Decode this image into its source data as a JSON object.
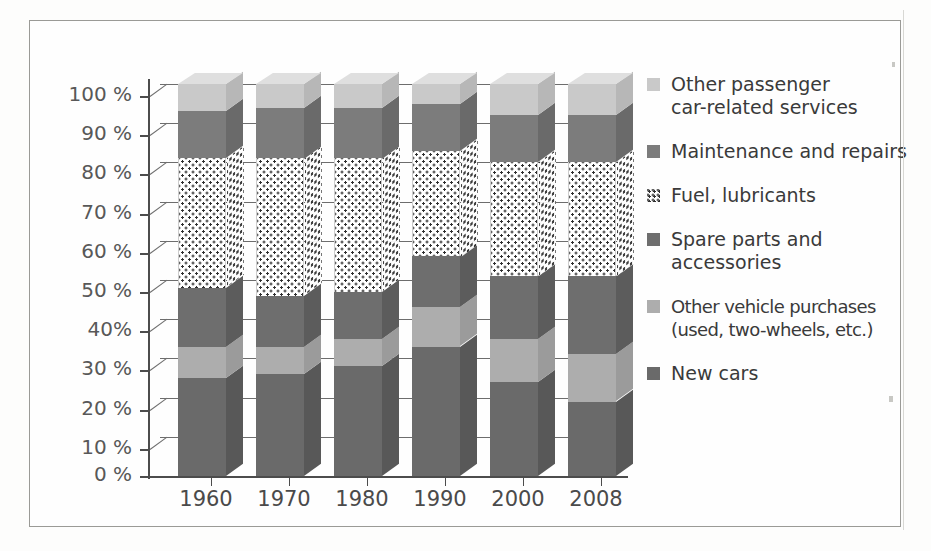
{
  "figure": {
    "kind": "stacked-bar-chart-100pct",
    "frame_border_color": "#9a9a96"
  },
  "axes": {
    "y_tick_labels": [
      "100 %",
      "90 %",
      "80 %",
      "70 %",
      "60 %",
      "50 %",
      "40%",
      "30 %",
      "20 %",
      "10 %",
      "0 %"
    ],
    "y_tick_values": [
      100,
      90,
      80,
      70,
      60,
      50,
      40,
      30,
      20,
      10,
      0
    ],
    "x_tick_labels": [
      "1960",
      "1970",
      "1980",
      "1990",
      "2000",
      "2008"
    ]
  },
  "legend": {
    "items": [
      {
        "label": "Other passenger\ncar-related services",
        "color": "#c9c9c9",
        "pattern": "solid",
        "name": "other-passenger-car-related-services"
      },
      {
        "label": "Maintenance and repairs",
        "color": "#7c7c7c",
        "pattern": "solid",
        "name": "maintenance-and-repairs"
      },
      {
        "label": "Fuel, lubricants",
        "color": "#ffffff",
        "pattern": "dotted",
        "name": "fuel-lubricants"
      },
      {
        "label": "Spare parts and\naccessories",
        "color": "#6e6e6e",
        "pattern": "solid",
        "name": "spare-parts-and-accessories"
      },
      {
        "label": "Other vehicle purchases\n(used, two-wheels, etc.)",
        "color": "#adadad",
        "pattern": "solid",
        "name": "other-vehicle-purchases"
      },
      {
        "label": "New cars",
        "color": "#6a6a6a",
        "pattern": "solid",
        "name": "new-cars"
      }
    ]
  },
  "chart_data": {
    "type": "bar",
    "stacked": true,
    "normalized": true,
    "title": "",
    "xlabel": "",
    "ylabel": "",
    "ylim": [
      0,
      100
    ],
    "grid": true,
    "legend_position": "right",
    "categories": [
      "1960",
      "1970",
      "1980",
      "1990",
      "2000",
      "2008"
    ],
    "series": [
      {
        "name": "New cars",
        "color": "#6a6a6a",
        "pattern": "solid",
        "values": [
          25,
          26,
          28,
          33,
          24,
          19
        ]
      },
      {
        "name": "Other vehicle purchases (used, two-wheels, etc.)",
        "color": "#adadad",
        "pattern": "solid",
        "values": [
          8,
          7,
          7,
          10,
          11,
          12
        ]
      },
      {
        "name": "Spare parts and accessories",
        "color": "#6e6e6e",
        "pattern": "solid",
        "values": [
          15,
          13,
          12,
          13,
          16,
          20
        ]
      },
      {
        "name": "Fuel, lubricants",
        "color": "#ffffff",
        "pattern": "dotted",
        "values": [
          33,
          35,
          34,
          27,
          29,
          29
        ]
      },
      {
        "name": "Maintenance and repairs",
        "color": "#7c7c7c",
        "pattern": "solid",
        "values": [
          12,
          13,
          13,
          12,
          12,
          12
        ]
      },
      {
        "name": "Other passenger car-related services",
        "color": "#c9c9c9",
        "pattern": "solid",
        "values": [
          7,
          6,
          6,
          5,
          8,
          8
        ]
      }
    ]
  }
}
